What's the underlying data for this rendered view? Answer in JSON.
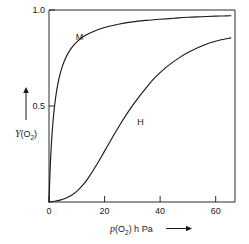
{
  "chart_data": {
    "type": "line",
    "title": "",
    "xlabel": "p(O2) hPa",
    "ylabel": "Y(O2)",
    "xlabel_main": "p",
    "xlabel_paren_open": "(O",
    "xlabel_sub": "2",
    "xlabel_paren_close": ") h Pa",
    "ylabel_main": "Y",
    "ylabel_paren_open": "(O",
    "ylabel_sub": "2",
    "ylabel_paren_close": ")",
    "xlim": [
      0,
      67
    ],
    "ylim": [
      0,
      1.0
    ],
    "xticks": [
      0,
      20,
      40,
      60
    ],
    "xticklabels": [
      "0",
      "20",
      "40",
      "60"
    ],
    "yticks": [
      0.5,
      1.0
    ],
    "yticklabels": [
      "0.5",
      "1.0"
    ],
    "grid": false,
    "legend": "inline-curve-labels",
    "axis_arrow_x": "right-arrow",
    "axis_arrow_y": "up-arrow",
    "series": [
      {
        "name": "M",
        "label": "M",
        "description": "myoglobin hyperbolic binding curve",
        "label_x": 11,
        "label_y": 0.845,
        "x": [
          0,
          0.4,
          0.8,
          1.2,
          1.6,
          2.0,
          2.6,
          3.2,
          4.0,
          5.0,
          6.0,
          7.0,
          8.0,
          9.5,
          11,
          13,
          15,
          18,
          21,
          25,
          30,
          35,
          40,
          45,
          50,
          55,
          60,
          63,
          65.5
        ],
        "y": [
          0,
          0.167,
          0.286,
          0.375,
          0.444,
          0.5,
          0.565,
          0.615,
          0.667,
          0.714,
          0.75,
          0.778,
          0.8,
          0.826,
          0.846,
          0.867,
          0.882,
          0.9,
          0.913,
          0.926,
          0.938,
          0.946,
          0.952,
          0.957,
          0.962,
          0.965,
          0.968,
          0.969,
          0.97
        ]
      },
      {
        "name": "H",
        "label": "H",
        "description": "hemoglobin sigmoidal cooperative binding curve",
        "label_x": 33,
        "label_y": 0.4,
        "x": [
          0,
          2,
          4,
          6,
          8,
          10,
          12,
          14,
          17,
          20,
          23,
          26,
          29,
          32,
          35,
          38,
          41,
          44,
          47,
          50,
          53,
          56,
          59,
          62,
          65.5
        ],
        "y": [
          0,
          0.004,
          0.01,
          0.02,
          0.034,
          0.055,
          0.085,
          0.122,
          0.19,
          0.265,
          0.34,
          0.413,
          0.48,
          0.54,
          0.595,
          0.645,
          0.687,
          0.722,
          0.752,
          0.778,
          0.8,
          0.818,
          0.833,
          0.845,
          0.855
        ]
      }
    ]
  },
  "figure": {
    "background_color": "#ffffff",
    "line_color": "#1a1a1a",
    "frame_color": "#2b2b2b"
  }
}
